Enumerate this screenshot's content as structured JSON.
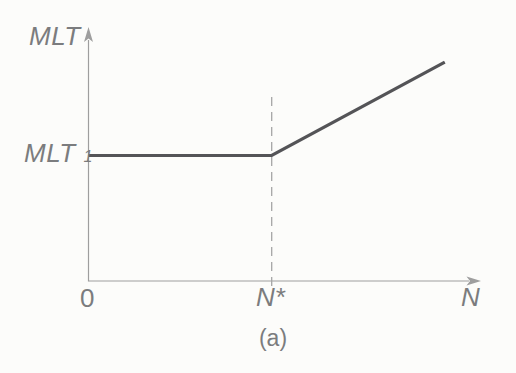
{
  "figure": {
    "caption": "(a)"
  },
  "labels": {
    "y_axis_title": "MLT",
    "y_tick_main": "MLT",
    "y_tick_sub": "1",
    "x_origin": "0",
    "x_tick": "N*",
    "x_axis_title": "N"
  },
  "colors": {
    "paper": "#fcfcfa",
    "axis": "#9e9e9e",
    "dashed": "#a6a6a6",
    "curve": "#545457",
    "text": "#7b7c7e"
  },
  "chart_data": {
    "type": "line",
    "title": "",
    "xlabel": "N",
    "ylabel": "MLT",
    "x_ticks": [
      "0",
      "N*"
    ],
    "y_ticks": [
      "MLT_1"
    ],
    "axes": {
      "x_range_norm": [
        0,
        1
      ],
      "y_range_norm": [
        0,
        1
      ],
      "grid": false,
      "legend": "none"
    },
    "series": [
      {
        "name": "MLT vs N",
        "points_norm": [
          {
            "x": 0.0,
            "y": 0.5
          },
          {
            "x": 0.468,
            "y": 0.5
          },
          {
            "x": 0.91,
            "y": 0.872
          }
        ]
      }
    ],
    "annotations": [
      {
        "type": "dashed-vline",
        "x_norm": 0.468,
        "label": "N*"
      }
    ],
    "caption": "(a)"
  }
}
